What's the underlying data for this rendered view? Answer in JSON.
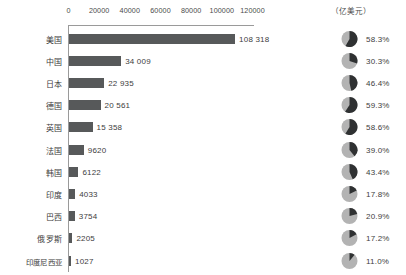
{
  "unit_header": "（亿美元）",
  "chart_data": {
    "type": "bar",
    "title": "",
    "subtitle": "",
    "xlabel": "",
    "ylabel": "",
    "unit": "（亿美元）",
    "orientation": "horizontal",
    "grid": false,
    "legend": false,
    "xlim": [
      0,
      120000
    ],
    "xticks": [
      0,
      20000,
      40000,
      60000,
      80000,
      100000,
      120000
    ],
    "xtick_labels": [
      "0",
      "20000",
      "40000",
      "60000",
      "80000",
      "100000",
      "120000"
    ],
    "categories": [
      "美国",
      "中国",
      "日本",
      "德国",
      "英国",
      "法国",
      "韩国",
      "印度",
      "巴西",
      "俄罗斯",
      "印度尼西亚"
    ],
    "values": [
      108318,
      34009,
      22935,
      20561,
      15358,
      9620,
      6122,
      4033,
      3754,
      2205,
      1027
    ],
    "value_labels": [
      "108 318",
      "34 009",
      "22 935",
      "20 561",
      "15 358",
      "9620",
      "6122",
      "4033",
      "3754",
      "2205",
      "1027"
    ],
    "bar_color": "#57595a",
    "secondary": {
      "type": "pie",
      "name": "占比",
      "values": [
        58.3,
        30.3,
        46.4,
        59.3,
        58.6,
        39.0,
        43.4,
        17.8,
        20.9,
        17.2,
        11.0
      ],
      "labels": [
        "58.3%",
        "30.3%",
        "46.4%",
        "59.3%",
        "58.6%",
        "39.0%",
        "43.4%",
        "17.8%",
        "20.9%",
        "17.2%",
        "11.0%"
      ],
      "slice_color": "#2f3132",
      "remainder_color": "#b3b3b3",
      "start_angle": 0,
      "direction": "clockwise"
    }
  }
}
